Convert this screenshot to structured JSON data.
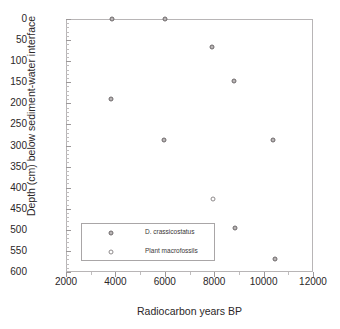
{
  "caption_sliver": "",
  "chart_data": {
    "type": "scatter",
    "title": "",
    "xlabel": "Radiocarbon years BP",
    "ylabel": "Depth (cm) below sediment-water interface",
    "xlim": [
      2000,
      12000
    ],
    "ylim": [
      0,
      600
    ],
    "y_inverted": true,
    "grid": false,
    "legend_position": "inside-lower-left",
    "xticks": [
      2000,
      4000,
      6000,
      8000,
      10000,
      12000
    ],
    "xtick_labels": [
      "2000",
      "4000",
      "6000",
      "8000",
      "10000",
      "12000"
    ],
    "yticks": [
      0,
      50,
      100,
      150,
      200,
      250,
      300,
      350,
      400,
      450,
      500,
      550,
      600
    ],
    "ytick_labels": [
      "0",
      "50",
      "100",
      "150",
      "200",
      "250",
      "300",
      "350",
      "400",
      "450",
      "500",
      "550",
      "600"
    ],
    "series": [
      {
        "name": "D. crassicostatus",
        "marker": "diamond",
        "points": [
          {
            "x": 3850,
            "y": 0
          },
          {
            "x": 6020,
            "y": 0
          },
          {
            "x": 3820,
            "y": 190
          },
          {
            "x": 5980,
            "y": 288
          },
          {
            "x": 7900,
            "y": 67
          },
          {
            "x": 8800,
            "y": 147
          },
          {
            "x": 8850,
            "y": 495
          },
          {
            "x": 10400,
            "y": 288
          },
          {
            "x": 10450,
            "y": 570
          }
        ]
      },
      {
        "name": "Plant macrofossils",
        "marker": "circle",
        "points": [
          {
            "x": 7950,
            "y": 428
          }
        ]
      }
    ]
  }
}
